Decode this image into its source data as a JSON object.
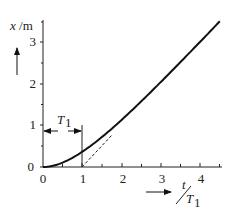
{
  "chart_data": {
    "type": "line",
    "title": "",
    "xlabel": "t/T1",
    "ylabel": "x /m",
    "xlim": [
      0,
      4.6
    ],
    "ylim": [
      0,
      3.55
    ],
    "x_ticks": [
      "0",
      "1",
      "2",
      "3",
      "4"
    ],
    "y_ticks": [
      "0",
      "1",
      "2",
      "3"
    ],
    "grid": false,
    "legend": null,
    "series": [
      {
        "name": "x(t)",
        "style": "solid",
        "x": [
          0,
          0.25,
          0.5,
          0.75,
          1.0,
          1.25,
          1.5,
          1.75,
          2.0,
          2.5,
          3.0,
          3.5,
          4.0,
          4.5
        ],
        "y": [
          0,
          0.03,
          0.11,
          0.22,
          0.37,
          0.54,
          0.72,
          0.92,
          1.14,
          1.58,
          2.05,
          2.53,
          3.02,
          3.51
        ]
      },
      {
        "name": "asymptote",
        "style": "dashed",
        "x": [
          1.0,
          1.75
        ],
        "y": [
          0,
          0.75
        ]
      }
    ],
    "annotations": [
      {
        "type": "double-arrow",
        "label": "T1",
        "from_x": 0,
        "to_x": 1,
        "y": 0.9
      },
      {
        "type": "vertical-line",
        "x": 1,
        "y_from": 0,
        "y_to": 1.0
      }
    ]
  },
  "labels": {
    "y_axis": "x /m",
    "x_axis_num": "t",
    "x_axis_den": "T",
    "x_axis_sub": "1",
    "t1_main": "T",
    "t1_sub": "1"
  },
  "tick_labels": {
    "x0": "0",
    "x1": "1",
    "x2": "2",
    "x3": "3",
    "x4": "4",
    "y0": "0",
    "y1": "1",
    "y2": "2",
    "y3": "3"
  }
}
